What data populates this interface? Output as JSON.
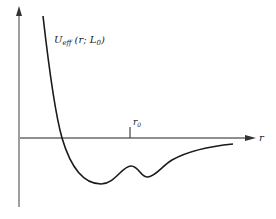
{
  "diagram": {
    "type": "effective-potential-curve",
    "curve_label": {
      "main": "U",
      "subscript": "eff",
      "args": "(r; L",
      "args_sub": "0",
      "close": ")"
    },
    "x_axis_label": "r",
    "marker_label": {
      "main": "r",
      "subscript": "0"
    },
    "colors": {
      "axis": "#6a6a6a",
      "curve": "#1a1a1a",
      "text": "#222222"
    }
  }
}
